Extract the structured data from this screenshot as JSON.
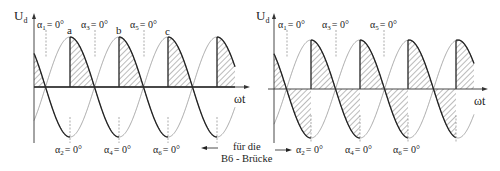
{
  "figure": {
    "caption_arrow_text_line1": "für die",
    "caption_arrow_text_line2": "B6 - Brücke",
    "colors": {
      "curve": "#777777",
      "envelope": "#222222",
      "hatch": "#555555",
      "axis": "#333333",
      "dashed": "#888888"
    }
  },
  "left": {
    "y_axis_label": "U",
    "y_axis_sub": "d",
    "x_axis_label": "ωt",
    "top_labels": [
      {
        "name": "α",
        "sub": "1",
        "value": "= 0°"
      },
      {
        "name": "α",
        "sub": "3",
        "value": "= 0°"
      },
      {
        "name": "α",
        "sub": "5",
        "value": "= 0°"
      }
    ],
    "bottom_labels": [
      {
        "name": "α",
        "sub": "2",
        "value": "= 0°"
      },
      {
        "name": "α",
        "sub": "4",
        "value": "= 0°"
      },
      {
        "name": "α",
        "sub": "6",
        "value": "= 0°"
      }
    ],
    "point_labels": [
      "a",
      "b",
      "c"
    ]
  },
  "right": {
    "y_axis_label": "U",
    "y_axis_sub": "d",
    "x_axis_label": "ωt",
    "top_labels": [
      {
        "name": "α",
        "sub": "1",
        "value": "= 0°"
      },
      {
        "name": "α",
        "sub": "3",
        "value": "= 0°"
      },
      {
        "name": "α",
        "sub": "5",
        "value": "= 0°"
      }
    ],
    "bottom_labels": [
      {
        "name": "α",
        "sub": "2",
        "value": "= 0°"
      },
      {
        "name": "α",
        "sub": "4",
        "value": "= 0°"
      },
      {
        "name": "α",
        "sub": "6",
        "value": "= 0°"
      }
    ]
  }
}
